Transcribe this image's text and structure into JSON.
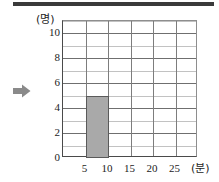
{
  "figure": {
    "pointer_icon": "right-arrow-icon",
    "pointer_color": "#8a8a8a",
    "top_rule_color": "#3a3a3a"
  },
  "chart_data": {
    "type": "bar",
    "title": "",
    "subtitle": "",
    "xlabel": "(분)",
    "ylabel": "(명)",
    "bar_color": "#a9a9a9",
    "bar_edge_color": "#5a5a5a",
    "grid": true,
    "legend": "none",
    "xlim": [
      0,
      30
    ],
    "ylim": [
      0,
      11
    ],
    "xticks": [
      5,
      10,
      15,
      20,
      25
    ],
    "xtick_labels": [
      "5",
      "10",
      "15",
      "20",
      "25"
    ],
    "yticks": [
      0,
      2,
      4,
      6,
      8,
      10
    ],
    "ytick_labels": [
      "0",
      "2",
      "4",
      "6",
      "8",
      "10"
    ],
    "y_minor_gridlines": [
      1,
      3,
      5,
      7,
      9,
      11
    ],
    "bin_width": 5,
    "bins": [
      {
        "start": 0,
        "end": 5,
        "value": 0
      },
      {
        "start": 5,
        "end": 10,
        "value": 5
      },
      {
        "start": 10,
        "end": 15,
        "value": 0
      },
      {
        "start": 15,
        "end": 20,
        "value": 0
      },
      {
        "start": 20,
        "end": 25,
        "value": 0
      },
      {
        "start": 25,
        "end": 30,
        "value": 0
      }
    ],
    "categories": [
      "0-5",
      "5-10",
      "10-15",
      "15-20",
      "20-25",
      "25-30"
    ],
    "values": [
      0,
      5,
      0,
      0,
      0,
      0
    ]
  }
}
